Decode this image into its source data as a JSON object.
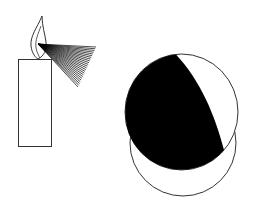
{
  "diagram": {
    "elements": [
      {
        "name": "candle",
        "description": "Rectangular candle with lit flame"
      },
      {
        "name": "flame",
        "description": "Teardrop flame outline"
      },
      {
        "name": "light-rays",
        "description": "Fan of light rays from flame toward sphere"
      },
      {
        "name": "sphere",
        "description": "Sphere partially lit; dark shaded side and lit crescent"
      }
    ],
    "colors": {
      "stroke": "#333333",
      "shadow": "#000000",
      "background": "#ffffff"
    },
    "ray_count": 24
  }
}
